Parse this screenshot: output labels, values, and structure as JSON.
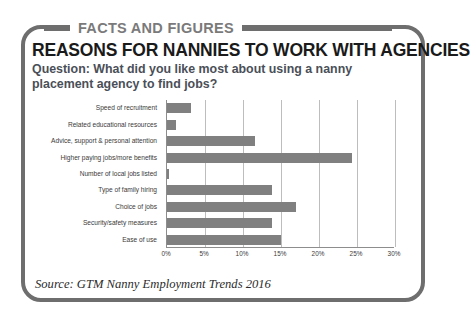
{
  "header": {
    "eyebrow": "FACTS AND FIGURES",
    "title": "REASONS FOR NANNIES TO WORK WITH AGENCIES",
    "question": "Question: What did you like most about using a nanny placement agency to find jobs?"
  },
  "source": "Source: GTM Nanny Employment Trends 2016",
  "colors": {
    "frame": "#6e6e6e",
    "eyebrow_text": "#7a7a7a",
    "title_text": "#1a1a1a",
    "question_text": "#4a4f58",
    "bar": "#808080",
    "gridline": "#bdbdbd",
    "axis": "#8d8d8d"
  },
  "chart_data": {
    "type": "bar",
    "orientation": "horizontal",
    "title": "REASONS FOR NANNIES TO WORK WITH AGENCIES",
    "subtitle": "Question: What did you like most about using a nanny placement agency to find jobs?",
    "xlabel": "",
    "ylabel": "",
    "xlim": [
      0,
      30
    ],
    "xticks": [
      "0%",
      "5%",
      "10%",
      "15%",
      "20%",
      "25%",
      "30%"
    ],
    "xtick_values": [
      0,
      5,
      10,
      15,
      20,
      25,
      30
    ],
    "grid": true,
    "legend": "none",
    "value_unit": "%",
    "categories": [
      "Speed of recruitment",
      "Related educational resources",
      "Advice, support & personal attention",
      "Higher paying jobs/more benefits",
      "Number of local jobs listed",
      "Type of family hiring",
      "Choice of jobs",
      "Security/safety measures",
      "Ease of use"
    ],
    "values": [
      3.2,
      1.2,
      11.6,
      24.3,
      0.2,
      13.8,
      17.0,
      13.8,
      15.0
    ],
    "source": "Source: GTM Nanny Employment Trends 2016"
  }
}
